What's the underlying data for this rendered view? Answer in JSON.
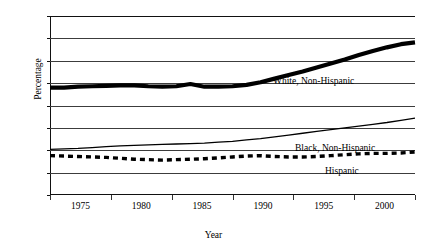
{
  "top_sliver_text": "",
  "axis": {
    "y_title": "Percentage",
    "x_title": "Year",
    "y_ticks": [
      0,
      5,
      10,
      15,
      20,
      25,
      30,
      35,
      40
    ],
    "x_ticks": [
      1975,
      1980,
      1985,
      1990,
      1995,
      2000
    ]
  },
  "labels": {
    "white": "White, Non-Hispanic",
    "black": "Black, Non-Hispanic",
    "hispanic": "Hispanic"
  },
  "chart_data": {
    "type": "line",
    "title": "",
    "xlabel": "Year",
    "ylabel": "Percentage",
    "xlim": [
      1974,
      2000
    ],
    "ylim": [
      0,
      40
    ],
    "ytick_step": 5,
    "grid": true,
    "legend": "inline-annotations",
    "x": [
      1974,
      1975,
      1976,
      1977,
      1978,
      1979,
      1980,
      1981,
      1982,
      1983,
      1984,
      1985,
      1986,
      1987,
      1988,
      1989,
      1990,
      1991,
      1992,
      1993,
      1994,
      1995,
      1996,
      1997,
      1998,
      1999,
      2000
    ],
    "series": [
      {
        "name": "White, Non-Hispanic",
        "style": "thick-solid",
        "color": "#000000",
        "values": [
          24.0,
          24.0,
          24.2,
          24.3,
          24.4,
          24.5,
          24.5,
          24.3,
          24.2,
          24.3,
          24.8,
          24.2,
          24.2,
          24.3,
          24.6,
          25.2,
          26.0,
          26.8,
          27.6,
          28.5,
          29.4,
          30.3,
          31.3,
          32.2,
          33.0,
          33.7,
          34.1
        ]
      },
      {
        "name": "Black, Non-Hispanic",
        "style": "thin-solid",
        "color": "#000000",
        "values": [
          10.2,
          10.3,
          10.4,
          10.6,
          10.8,
          11.0,
          11.1,
          11.2,
          11.3,
          11.4,
          11.5,
          11.6,
          11.8,
          12.0,
          12.3,
          12.6,
          13.0,
          13.4,
          13.8,
          14.2,
          14.6,
          15.0,
          15.4,
          15.8,
          16.2,
          16.7,
          17.2
        ]
      },
      {
        "name": "Hispanic",
        "style": "dashed",
        "color": "#000000",
        "values": [
          8.8,
          8.7,
          8.6,
          8.5,
          8.4,
          8.2,
          8.0,
          7.9,
          7.8,
          7.9,
          8.0,
          8.1,
          8.3,
          8.5,
          8.7,
          8.8,
          8.6,
          8.5,
          8.5,
          8.6,
          8.8,
          9.0,
          9.2,
          9.3,
          9.3,
          9.4,
          9.6
        ]
      }
    ]
  }
}
